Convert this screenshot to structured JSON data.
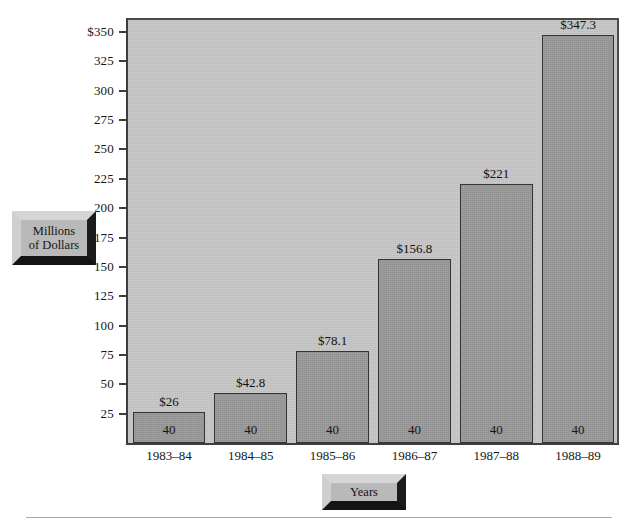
{
  "chart_data": {
    "type": "bar",
    "title": "",
    "xlabel": "Years",
    "ylabel": "Millions of Dollars",
    "categories": [
      "1983–84",
      "1984–85",
      "1985–86",
      "1986–87",
      "1987–88",
      "1988–89"
    ],
    "values": [
      26,
      42.8,
      78.1,
      156.8,
      221,
      347.3
    ],
    "value_labels": [
      "$26",
      "$42.8",
      "$78.1",
      "$156.8",
      "$221",
      "$347.3"
    ],
    "bar_inner_labels": [
      "40",
      "40",
      "40",
      "40",
      "40",
      "40"
    ],
    "ylim": [
      0,
      362
    ],
    "yticks": [
      25,
      50,
      75,
      100,
      125,
      150,
      175,
      200,
      225,
      250,
      275,
      300,
      325,
      350
    ],
    "ytick_labels": [
      "25",
      "50",
      "75",
      "100",
      "125",
      "150",
      "175",
      "200",
      "225",
      "250",
      "275",
      "300",
      "325",
      "350"
    ],
    "ytick_top_label": "$350",
    "grid": false,
    "legend": null,
    "colors": {
      "plot_background": "#c6c6c6",
      "bar_fill": "#989898",
      "bar_border": "#333333",
      "axis": "#3d3d3d",
      "text": "#161616",
      "plate_face": "#b9b9b9",
      "plate_highlight": "#d6d6d6",
      "plate_shadow": "#141414",
      "page_background": "#ffffff",
      "rule": "#a9a9a9"
    }
  },
  "axis": {
    "y_title": "Millions\nof Dollars",
    "y_title_line1": "Millions",
    "y_title_line2": "of Dollars",
    "x_title": "Years"
  }
}
